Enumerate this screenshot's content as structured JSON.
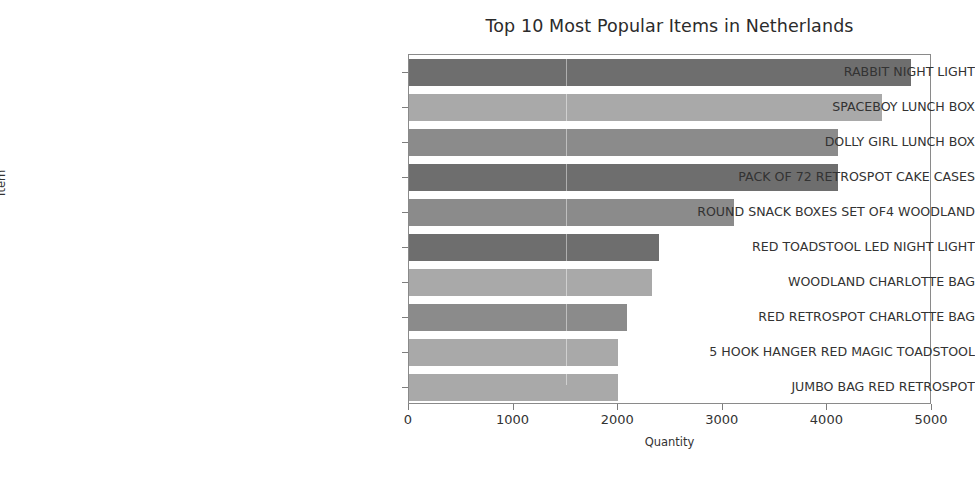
{
  "chart_data": {
    "type": "bar",
    "orientation": "horizontal",
    "title": "Top 10 Most Popular Items in Netherlands",
    "xlabel": "Quantity",
    "ylabel": "Item",
    "xlim": [
      0,
      5000
    ],
    "xticks": [
      0,
      1000,
      2000,
      3000,
      4000,
      5000
    ],
    "xtick_labels": [
      "0",
      "1000",
      "2000",
      "3000",
      "4000",
      "5000"
    ],
    "grid": false,
    "legend": null,
    "categories": [
      "RABBIT NIGHT LIGHT",
      "SPACEBOY LUNCH BOX",
      "DOLLY GIRL LUNCH BOX",
      "PACK OF 72 RETROSPOT CAKE CASES",
      "ROUND SNACK BOXES SET OF4 WOODLAND",
      "RED TOADSTOOL LED NIGHT LIGHT",
      "WOODLAND CHARLOTTE BAG",
      "RED RETROSPOT CHARLOTTE BAG",
      "5 HOOK HANGER RED MAGIC TOADSTOOL",
      "JUMBO BAG RED RETROSPOT"
    ],
    "values": [
      4800,
      4520,
      4100,
      4100,
      3110,
      2390,
      2320,
      2080,
      2000,
      2000
    ],
    "bar_colors": [
      "#6e6e6e",
      "#a9a9a9",
      "#8b8b8b",
      "#6e6e6e",
      "#8b8b8b",
      "#6e6e6e",
      "#a9a9a9",
      "#8b8b8b",
      "#a9a9a9",
      "#a9a9a9"
    ]
  },
  "axis_color": "#8a8a8a",
  "text_color": "#333333"
}
